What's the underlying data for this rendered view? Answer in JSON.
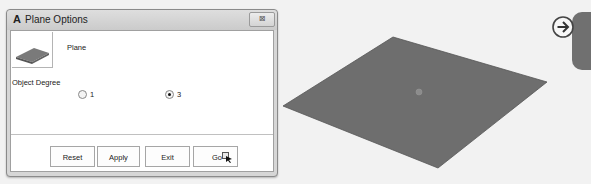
{
  "dialog": {
    "title": "Plane Options",
    "title_icon": "A",
    "close_glyph": "⊠",
    "object_type_label": "Plane",
    "degree_label": "Object Degree",
    "degree_options": [
      {
        "label": "1",
        "selected": false
      },
      {
        "label": "3",
        "selected": true
      }
    ],
    "buttons": {
      "reset": "Reset",
      "apply": "Apply",
      "exit": "Exit",
      "go": "Go"
    }
  },
  "viewport": {
    "object": "plane",
    "plane_color": "#6e6e6e",
    "nav_icon": "arrow-right-circle-icon"
  }
}
